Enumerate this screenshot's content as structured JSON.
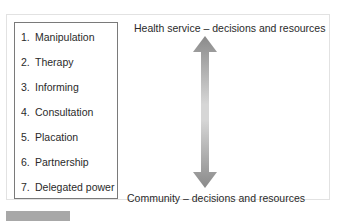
{
  "diagram": {
    "ladder": {
      "items": [
        {
          "num": "1.",
          "label": "Manipulation"
        },
        {
          "num": "2.",
          "label": "Therapy"
        },
        {
          "num": "3.",
          "label": "Informing"
        },
        {
          "num": "4.",
          "label": "Consultation"
        },
        {
          "num": "5.",
          "label": "Placation"
        },
        {
          "num": "6.",
          "label": "Partnership"
        },
        {
          "num": "7.",
          "label": "Delegated power"
        }
      ]
    },
    "top_label": "Health service – decisions and resources",
    "bottom_label": "Community – decisions and resources",
    "arrow": {
      "type": "double-headed-vertical",
      "color_end": "#8a8a8a",
      "color_mid": "#d6d6d6"
    }
  }
}
